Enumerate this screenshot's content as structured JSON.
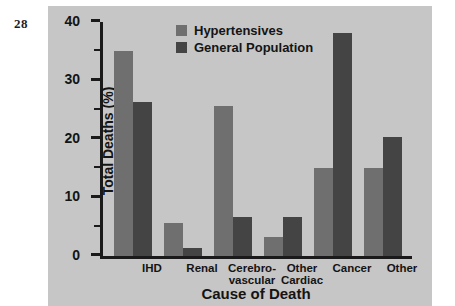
{
  "page": {
    "folio": "28"
  },
  "chart_data": {
    "type": "bar",
    "title": "",
    "xlabel": "Cause of Death",
    "ylabel": "Total Deaths (%)",
    "ylim": [
      0,
      40
    ],
    "yticks": [
      0,
      10,
      20,
      30,
      40
    ],
    "ytick_labels": [
      "0",
      "10",
      "20",
      "30",
      "40"
    ],
    "yminor_ticks": [
      5,
      15,
      25,
      35
    ],
    "grid": false,
    "legend_position": "top-center",
    "categories": [
      "IHD",
      "Renal",
      "Cerebro-vascular",
      "Other Cardiac",
      "Cancer",
      "Other"
    ],
    "category_lines": [
      [
        "IHD"
      ],
      [
        "Renal"
      ],
      [
        "Cerebro-",
        "vascular"
      ],
      [
        "Other",
        "Cardiac"
      ],
      [
        "Cancer"
      ],
      [
        "Other"
      ]
    ],
    "series": [
      {
        "name": "Hypertensives",
        "color": "#6f6f6f",
        "values": [
          35.0,
          5.6,
          25.6,
          3.3,
          15.1,
          15.1
        ]
      },
      {
        "name": "General Population",
        "color": "#444444",
        "values": [
          26.3,
          1.3,
          6.7,
          6.7,
          38.2,
          20.3
        ]
      }
    ]
  },
  "colors": {
    "panel_background": "#c6c6c6",
    "axis": "#1a1a1a",
    "text": "#141414",
    "hypertensives": "#6f6f6f",
    "general_population": "#444444"
  }
}
